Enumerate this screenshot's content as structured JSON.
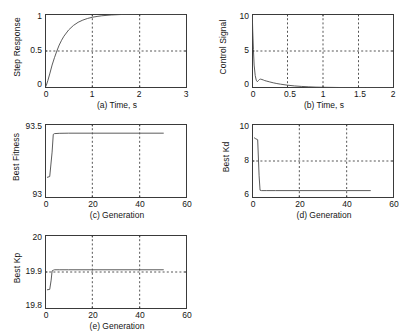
{
  "figure": {
    "background_color": "#ffffff",
    "axis_color": "#3a3a3a",
    "curve_color": "#4a4a4a",
    "grid_color": "#2b2b2b"
  },
  "chart_data": [
    {
      "id": "a",
      "type": "line",
      "title": "",
      "xlabel": "(a) Time, s",
      "ylabel": "Step Response",
      "xlim": [
        0,
        3
      ],
      "ylim": [
        0,
        1
      ],
      "xticks": [
        0,
        1,
        2,
        3
      ],
      "xticklabels": [
        "0",
        "1",
        "2",
        "3"
      ],
      "yticks": [
        0,
        0.5,
        1
      ],
      "yticklabels": [
        "0",
        "0.5",
        "1"
      ],
      "grid": true,
      "grid_style": "dashed",
      "legend": null,
      "x": [
        0,
        0.03,
        0.06,
        0.1,
        0.15,
        0.2,
        0.25,
        0.3,
        0.35,
        0.4,
        0.5,
        0.6,
        0.7,
        0.8,
        0.9,
        1.0,
        1.1,
        1.2,
        1.4,
        1.6,
        1.8,
        2.0,
        2.4,
        3.0
      ],
      "y": [
        0,
        0.04,
        0.1,
        0.19,
        0.31,
        0.41,
        0.5,
        0.58,
        0.645,
        0.7,
        0.785,
        0.845,
        0.888,
        0.918,
        0.94,
        0.956,
        0.967,
        0.976,
        0.987,
        0.993,
        0.996,
        0.998,
        0.999,
        1.0
      ]
    },
    {
      "id": "b",
      "type": "line",
      "title": "",
      "xlabel": "(b) Time, s",
      "ylabel": "Control Signal",
      "xlim": [
        0,
        2
      ],
      "ylim": [
        0,
        10
      ],
      "xticks": [
        0,
        0.5,
        1,
        1.5,
        2
      ],
      "xticklabels": [
        "0",
        "0.5",
        "1",
        "1.5",
        "2"
      ],
      "yticks": [
        0,
        5,
        10
      ],
      "yticklabels": [
        "0",
        "5",
        "10"
      ],
      "grid": true,
      "grid_style": "dashed",
      "legend": null,
      "x": [
        0,
        0.005,
        0.01,
        0.02,
        0.03,
        0.045,
        0.06,
        0.075,
        0.09,
        0.105,
        0.12,
        0.14,
        0.16,
        0.18,
        0.2,
        0.25,
        0.3,
        0.35,
        0.4,
        0.5,
        0.6,
        0.7,
        0.8,
        0.9,
        1.0,
        1.2,
        1.4,
        1.6,
        1.8,
        2.0
      ],
      "y": [
        10,
        9.6,
        7.8,
        5.2,
        3.1,
        1.7,
        1.05,
        0.85,
        1.0,
        1.15,
        1.2,
        1.15,
        1.08,
        1.0,
        0.95,
        0.82,
        0.7,
        0.6,
        0.52,
        0.38,
        0.28,
        0.21,
        0.16,
        0.12,
        0.1,
        0.07,
        0.05,
        0.04,
        0.03,
        0.02
      ]
    },
    {
      "id": "c",
      "type": "line",
      "title": "",
      "xlabel": "(c) Generation",
      "ylabel": "Best Fitness",
      "xlim": [
        0,
        60
      ],
      "ylim": [
        93,
        93.5
      ],
      "xticks": [
        0,
        20,
        40,
        60
      ],
      "xticklabels": [
        "0",
        "20",
        "40",
        "60"
      ],
      "yticks": [
        93,
        93.5
      ],
      "yticklabels": [
        "93",
        "93.5"
      ],
      "grid": true,
      "grid_style": "dashed",
      "legend": null,
      "x": [
        1,
        2,
        3,
        3.5,
        4,
        6,
        10,
        20,
        30,
        40,
        50
      ],
      "y": [
        93.14,
        93.145,
        93.31,
        93.43,
        93.435,
        93.437,
        93.438,
        93.438,
        93.438,
        93.438,
        93.438
      ]
    },
    {
      "id": "d",
      "type": "line",
      "title": "",
      "xlabel": "(d) Generation",
      "ylabel": "Best Kd",
      "xlim": [
        0,
        60
      ],
      "ylim": [
        6,
        10
      ],
      "xticks": [
        0,
        20,
        40,
        60
      ],
      "xticklabels": [
        "0",
        "20",
        "40",
        "60"
      ],
      "yticks": [
        6,
        8,
        10
      ],
      "yticklabels": [
        "6",
        "8",
        "10"
      ],
      "grid": true,
      "grid_style": "dashed",
      "legend": null,
      "x": [
        1,
        1.6,
        2.4,
        3,
        3.4,
        4,
        6,
        10,
        20,
        30,
        40,
        50
      ],
      "y": [
        9.25,
        9.2,
        9.15,
        7.2,
        6.42,
        6.4,
        6.4,
        6.4,
        6.4,
        6.4,
        6.4,
        6.4
      ]
    },
    {
      "id": "e",
      "type": "line",
      "title": "",
      "xlabel": "(e) Generation",
      "ylabel": "Best Kp",
      "xlim": [
        0,
        60
      ],
      "ylim": [
        19.8,
        20
      ],
      "xticks": [
        0,
        20,
        40,
        60
      ],
      "xticklabels": [
        "0",
        "20",
        "40",
        "60"
      ],
      "yticks": [
        19.8,
        19.9,
        20
      ],
      "yticklabels": [
        "19.8",
        "19.9",
        "20"
      ],
      "grid": true,
      "grid_style": "dashed",
      "legend": null,
      "x": [
        1,
        2,
        2.6,
        3,
        3.6,
        4,
        6,
        10,
        20,
        30,
        40,
        50
      ],
      "y": [
        19.852,
        19.853,
        19.878,
        19.903,
        19.905,
        19.906,
        19.906,
        19.906,
        19.906,
        19.906,
        19.906,
        19.906
      ]
    }
  ]
}
